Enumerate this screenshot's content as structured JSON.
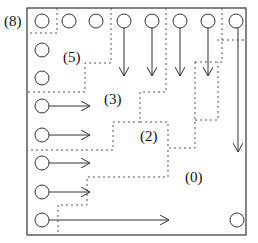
{
  "diagram": {
    "labels": {
      "corner": "(8)",
      "region5": "(5)",
      "region3": "(3)",
      "region2": "(2)",
      "region0": "(0)"
    },
    "stroke_color": "#333333",
    "dotted_color": "#555555",
    "top_row_nodes": 8,
    "left_column_nodes": 8,
    "down_arrows": 5,
    "right_arrows": 5,
    "long_down_arrow": 1,
    "long_right_arrow": 1,
    "bottom_right_node": 1
  }
}
